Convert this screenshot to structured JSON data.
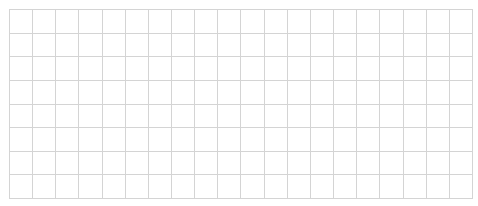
{
  "grid": {
    "rows": 8,
    "columns": 20,
    "line_color": "#d4d4d4",
    "background": "#ffffff",
    "cells": [
      [
        "",
        "",
        "",
        "",
        "",
        "",
        "",
        "",
        "",
        "",
        "",
        "",
        "",
        "",
        "",
        "",
        "",
        "",
        "",
        ""
      ],
      [
        "",
        "",
        "",
        "",
        "",
        "",
        "",
        "",
        "",
        "",
        "",
        "",
        "",
        "",
        "",
        "",
        "",
        "",
        "",
        ""
      ],
      [
        "",
        "",
        "",
        "",
        "",
        "",
        "",
        "",
        "",
        "",
        "",
        "",
        "",
        "",
        "",
        "",
        "",
        "",
        "",
        ""
      ],
      [
        "",
        "",
        "",
        "",
        "",
        "",
        "",
        "",
        "",
        "",
        "",
        "",
        "",
        "",
        "",
        "",
        "",
        "",
        "",
        ""
      ],
      [
        "",
        "",
        "",
        "",
        "",
        "",
        "",
        "",
        "",
        "",
        "",
        "",
        "",
        "",
        "",
        "",
        "",
        "",
        "",
        ""
      ],
      [
        "",
        "",
        "",
        "",
        "",
        "",
        "",
        "",
        "",
        "",
        "",
        "",
        "",
        "",
        "",
        "",
        "",
        "",
        "",
        ""
      ],
      [
        "",
        "",
        "",
        "",
        "",
        "",
        "",
        "",
        "",
        "",
        "",
        "",
        "",
        "",
        "",
        "",
        "",
        "",
        "",
        ""
      ],
      [
        "",
        "",
        "",
        "",
        "",
        "",
        "",
        "",
        "",
        "",
        "",
        "",
        "",
        "",
        "",
        "",
        "",
        "",
        "",
        ""
      ]
    ]
  }
}
